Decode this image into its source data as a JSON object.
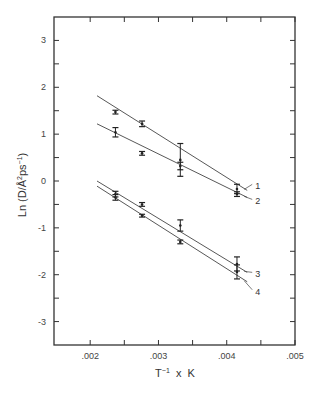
{
  "chart_data": {
    "type": "line",
    "title": "",
    "xlabel": "T⁻¹ x K",
    "ylabel": "Ln (D/Å²ps⁻¹)",
    "xlim": [
      0.00147,
      0.005
    ],
    "ylim": [
      -3.5,
      3.5
    ],
    "x_ticks": [
      0.002,
      0.003,
      0.004,
      0.005
    ],
    "x_tick_labels": [
      ".002",
      ".003",
      ".004",
      ".005"
    ],
    "x_minor_ticks": [
      0.0025,
      0.0035,
      0.0045
    ],
    "y_ticks": [
      -3,
      -2,
      -1,
      0,
      1,
      2,
      3
    ],
    "y_tick_labels": [
      "-3",
      "-2",
      "-1",
      "0",
      "1",
      "2",
      "3"
    ],
    "y_minor_ticks": [
      -2.5,
      -1.5,
      -0.5,
      0.5,
      1.5,
      2.5
    ],
    "grid": false,
    "legend": "inline labels at right end of lines",
    "series": [
      {
        "name": "1",
        "x": [
          0.00237,
          0.00276,
          0.00332,
          0.00415
        ],
        "y": [
          1.47,
          1.22,
          0.45,
          -0.17
        ],
        "yerr": [
          0.04,
          0.06,
          0.35,
          0.1
        ],
        "fit": {
          "x": [
            0.0021,
            0.0043
          ],
          "y": [
            1.82,
            -0.2
          ]
        }
      },
      {
        "name": "2",
        "x": [
          0.00237,
          0.00276,
          0.00332,
          0.00415
        ],
        "y": [
          1.04,
          0.59,
          0.32,
          -0.28
        ],
        "yerr": [
          0.1,
          0.04,
          0.08,
          0.05
        ],
        "fit": {
          "x": [
            0.0021,
            0.0043
          ],
          "y": [
            1.22,
            -0.35
          ]
        }
      },
      {
        "name": "3",
        "x": [
          0.00237,
          0.00276,
          0.00332,
          0.00415
        ],
        "y": [
          -0.28,
          -0.5,
          -0.95,
          -1.77
        ],
        "yerr": [
          0.06,
          0.04,
          0.12,
          0.15
        ],
        "fit": {
          "x": [
            0.0021,
            0.0043
          ],
          "y": [
            0.0,
            -1.95
          ]
        }
      },
      {
        "name": "4",
        "x": [
          0.00237,
          0.00276,
          0.00332,
          0.00415
        ],
        "y": [
          -0.35,
          -0.74,
          -1.3,
          -1.94
        ],
        "yerr": [
          0.06,
          0.03,
          0.04,
          0.15
        ],
        "fit": {
          "x": [
            0.0021,
            0.0043
          ],
          "y": [
            -0.11,
            -2.15
          ]
        }
      }
    ]
  }
}
